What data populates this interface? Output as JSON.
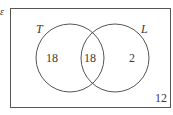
{
  "diagram": {
    "type": "venn",
    "universal_set_symbol": "ε",
    "sets": [
      {
        "name": "T",
        "only_count": "18"
      },
      {
        "name": "L",
        "only_count": "2"
      }
    ],
    "intersection_count": "18",
    "outside_count": "12"
  }
}
